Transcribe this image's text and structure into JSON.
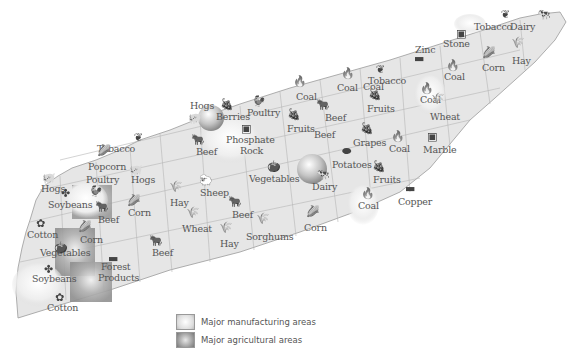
{
  "map": {
    "colors": {
      "land": "#e6e6e6",
      "border": "#9a9a9a",
      "county_line": "#b5b5b5",
      "manufacturing": "#f4f4f4",
      "agricultural": "#a8a8a8",
      "text": "#555555"
    },
    "labels": [
      {
        "text": "Tobacco",
        "x": 474,
        "y": 30
      },
      {
        "text": "Dairy",
        "x": 510,
        "y": 30
      },
      {
        "text": "Stone",
        "x": 443,
        "y": 47
      },
      {
        "text": "Zinc",
        "x": 415,
        "y": 53
      },
      {
        "text": "Corn",
        "x": 482,
        "y": 71
      },
      {
        "text": "Hay",
        "x": 512,
        "y": 64
      },
      {
        "text": "Coal",
        "x": 444,
        "y": 80
      },
      {
        "text": "Coal",
        "x": 363,
        "y": 90
      },
      {
        "text": "Tobacco",
        "x": 368,
        "y": 84
      },
      {
        "text": "Coal",
        "x": 337,
        "y": 91
      },
      {
        "text": "Coal",
        "x": 420,
        "y": 103
      },
      {
        "text": "Coal",
        "x": 296,
        "y": 100
      },
      {
        "text": "Fruits",
        "x": 367,
        "y": 112
      },
      {
        "text": "Wheat",
        "x": 430,
        "y": 120
      },
      {
        "text": "Beef",
        "x": 325,
        "y": 121
      },
      {
        "text": "Fruits",
        "x": 287,
        "y": 132
      },
      {
        "text": "Beef",
        "x": 314,
        "y": 138
      },
      {
        "text": "Hogs",
        "x": 190,
        "y": 109
      },
      {
        "text": "Berries",
        "x": 216,
        "y": 120
      },
      {
        "text": "Poultry",
        "x": 247,
        "y": 116
      },
      {
        "text": "Phosphate",
        "x": 226,
        "y": 143
      },
      {
        "text": "Rock",
        "x": 240,
        "y": 154
      },
      {
        "text": "Marble",
        "x": 423,
        "y": 153
      },
      {
        "text": "Grapes",
        "x": 353,
        "y": 146
      },
      {
        "text": "Coal",
        "x": 389,
        "y": 152
      },
      {
        "text": "Tobacco",
        "x": 97,
        "y": 152
      },
      {
        "text": "Beef",
        "x": 196,
        "y": 155
      },
      {
        "text": "Popcorn",
        "x": 88,
        "y": 170
      },
      {
        "text": "Poultry",
        "x": 86,
        "y": 183
      },
      {
        "text": "Hogs",
        "x": 131,
        "y": 183
      },
      {
        "text": "Potatoes",
        "x": 332,
        "y": 168
      },
      {
        "text": "Fruits",
        "x": 373,
        "y": 183
      },
      {
        "text": "Vegetables",
        "x": 249,
        "y": 182
      },
      {
        "text": "Dairy",
        "x": 312,
        "y": 190
      },
      {
        "text": "Hogs",
        "x": 41,
        "y": 192
      },
      {
        "text": "Sheep",
        "x": 200,
        "y": 196
      },
      {
        "text": "Coal",
        "x": 358,
        "y": 209
      },
      {
        "text": "Copper",
        "x": 398,
        "y": 205
      },
      {
        "text": "Soybeans",
        "x": 48,
        "y": 208
      },
      {
        "text": "Hay",
        "x": 170,
        "y": 206
      },
      {
        "text": "Beef",
        "x": 98,
        "y": 223
      },
      {
        "text": "Corn",
        "x": 128,
        "y": 216
      },
      {
        "text": "Beef",
        "x": 232,
        "y": 218
      },
      {
        "text": "Cotton",
        "x": 27,
        "y": 238
      },
      {
        "text": "Wheat",
        "x": 182,
        "y": 232
      },
      {
        "text": "Sorghums",
        "x": 246,
        "y": 240
      },
      {
        "text": "Corn",
        "x": 304,
        "y": 231
      },
      {
        "text": "Corn",
        "x": 80,
        "y": 243
      },
      {
        "text": "Hay",
        "x": 220,
        "y": 247
      },
      {
        "text": "Vegetables",
        "x": 40,
        "y": 256
      },
      {
        "text": "Beef",
        "x": 152,
        "y": 256
      },
      {
        "text": "Forest",
        "x": 101,
        "y": 270
      },
      {
        "text": "Products",
        "x": 98,
        "y": 281
      },
      {
        "text": "Soybeans",
        "x": 32,
        "y": 282
      },
      {
        "text": "Cotton",
        "x": 47,
        "y": 311
      }
    ],
    "icons": [
      {
        "name": "tobacco-leaf-icon",
        "glyph": "❦",
        "x": 507,
        "y": 16
      },
      {
        "name": "dairy-cow-icon",
        "glyph": "🐄",
        "x": 543,
        "y": 16
      },
      {
        "name": "stone-icon",
        "glyph": "▣",
        "x": 462,
        "y": 35
      },
      {
        "name": "zinc-bar-icon",
        "glyph": "▬",
        "x": 420,
        "y": 60
      },
      {
        "name": "corn-icon",
        "glyph": "🌽",
        "x": 488,
        "y": 54
      },
      {
        "name": "hay-icon",
        "glyph": "🌾",
        "x": 517,
        "y": 44
      },
      {
        "name": "coal-flame-icon",
        "glyph": "🔥",
        "x": 452,
        "y": 67
      },
      {
        "name": "coal-flame-icon",
        "glyph": "🔥",
        "x": 426,
        "y": 90
      },
      {
        "name": "tobacco-leaf-icon",
        "glyph": "❦",
        "x": 382,
        "y": 71
      },
      {
        "name": "coal-flame-icon",
        "glyph": "🔥",
        "x": 347,
        "y": 75
      },
      {
        "name": "coal-flame-icon",
        "glyph": "🔥",
        "x": 299,
        "y": 83
      },
      {
        "name": "fruits-icon",
        "glyph": "🍇",
        "x": 374,
        "y": 96
      },
      {
        "name": "wheat-icon",
        "glyph": "🌾",
        "x": 437,
        "y": 100
      },
      {
        "name": "beef-cow-icon",
        "glyph": "🐂",
        "x": 322,
        "y": 106
      },
      {
        "name": "fruits-icon",
        "glyph": "🍇",
        "x": 293,
        "y": 116
      },
      {
        "name": "hogs-icon",
        "glyph": "🐖",
        "x": 194,
        "y": 120
      },
      {
        "name": "berries-icon",
        "glyph": "🍇",
        "x": 226,
        "y": 106
      },
      {
        "name": "poultry-icon",
        "glyph": "🐓",
        "x": 258,
        "y": 103
      },
      {
        "name": "phosphate-rock-icon",
        "glyph": "▣",
        "x": 247,
        "y": 130
      },
      {
        "name": "marble-icon",
        "glyph": "▣",
        "x": 433,
        "y": 138
      },
      {
        "name": "grapes-icon",
        "glyph": "🍇",
        "x": 366,
        "y": 130
      },
      {
        "name": "coal-flame-icon",
        "glyph": "🔥",
        "x": 397,
        "y": 138
      },
      {
        "name": "tobacco-leaf-icon",
        "glyph": "❦",
        "x": 140,
        "y": 139
      },
      {
        "name": "beef-cow-icon",
        "glyph": "🐂",
        "x": 197,
        "y": 141
      },
      {
        "name": "corn-icon",
        "glyph": "🌽",
        "x": 103,
        "y": 152
      },
      {
        "name": "hogs-icon",
        "glyph": "🐖",
        "x": 135,
        "y": 172
      },
      {
        "name": "potatoes-icon",
        "glyph": "⬬",
        "x": 348,
        "y": 153
      },
      {
        "name": "fruits-icon",
        "glyph": "🍇",
        "x": 378,
        "y": 168
      },
      {
        "name": "vegetables-icon",
        "glyph": "🍅",
        "x": 273,
        "y": 168
      },
      {
        "name": "dairy-cow-icon",
        "glyph": "🐄",
        "x": 322,
        "y": 176
      },
      {
        "name": "hogs-icon",
        "glyph": "🐖",
        "x": 48,
        "y": 180
      },
      {
        "name": "sheep-icon",
        "glyph": "🐑",
        "x": 205,
        "y": 182
      },
      {
        "name": "coal-flame-icon",
        "glyph": "🔥",
        "x": 367,
        "y": 195
      },
      {
        "name": "copper-bar-icon",
        "glyph": "▬",
        "x": 411,
        "y": 190
      },
      {
        "name": "soybeans-icon",
        "glyph": "✤",
        "x": 67,
        "y": 195
      },
      {
        "name": "poultry-icon",
        "glyph": "🐓",
        "x": 95,
        "y": 193
      },
      {
        "name": "wheat-icon",
        "glyph": "🌾",
        "x": 175,
        "y": 188
      },
      {
        "name": "beef-cow-icon",
        "glyph": "🐂",
        "x": 101,
        "y": 208
      },
      {
        "name": "corn-icon",
        "glyph": "🌽",
        "x": 133,
        "y": 202
      },
      {
        "name": "beef-cow-icon",
        "glyph": "🐂",
        "x": 234,
        "y": 203
      },
      {
        "name": "cotton-icon",
        "glyph": "✿",
        "x": 42,
        "y": 225
      },
      {
        "name": "wheat-icon",
        "glyph": "🌾",
        "x": 192,
        "y": 214
      },
      {
        "name": "sorghums-icon",
        "glyph": "🌾",
        "x": 262,
        "y": 220
      },
      {
        "name": "corn-icon",
        "glyph": "🌽",
        "x": 312,
        "y": 213
      },
      {
        "name": "corn-icon",
        "glyph": "🌽",
        "x": 84,
        "y": 228
      },
      {
        "name": "hay-icon",
        "glyph": "🌾",
        "x": 225,
        "y": 229
      },
      {
        "name": "vegetables-icon",
        "glyph": "🍅",
        "x": 60,
        "y": 249
      },
      {
        "name": "beef-cow-icon",
        "glyph": "🐂",
        "x": 155,
        "y": 242
      },
      {
        "name": "forest-products-icon",
        "glyph": "▬",
        "x": 114,
        "y": 260
      },
      {
        "name": "soybeans-icon",
        "glyph": "✤",
        "x": 50,
        "y": 271
      },
      {
        "name": "cotton-icon",
        "glyph": "✿",
        "x": 61,
        "y": 299
      }
    ]
  },
  "legend": {
    "items": [
      {
        "label": "Major manufacturing areas",
        "kind": "manufacturing"
      },
      {
        "label": "Major agricultural areas",
        "kind": "agricultural"
      }
    ]
  }
}
